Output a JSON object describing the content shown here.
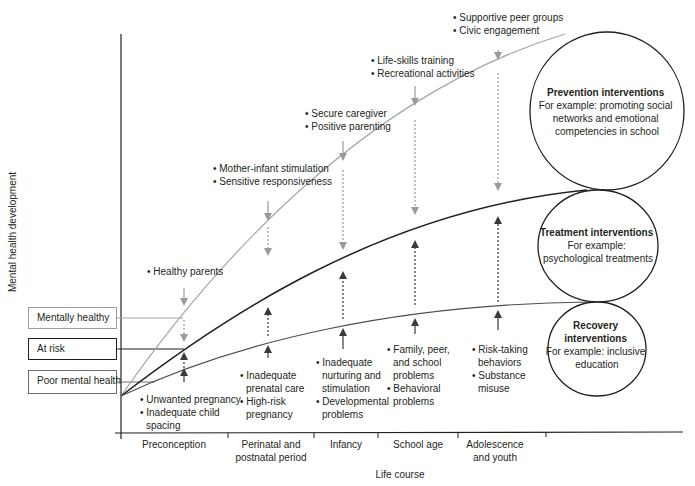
{
  "axes": {
    "y_label": "Mental health development",
    "x_label": "Life course",
    "stages": [
      {
        "lines": [
          "Preconception"
        ],
        "cx": 174
      },
      {
        "lines": [
          "Perinatal and",
          "postnatal period"
        ],
        "cx": 271
      },
      {
        "lines": [
          "Infancy"
        ],
        "cx": 346
      },
      {
        "lines": [
          "School age"
        ],
        "cx": 418
      },
      {
        "lines": [
          "Adolescence",
          "and youth"
        ],
        "cx": 495
      }
    ]
  },
  "levels": [
    {
      "label": "Mentally healthy",
      "border": "#9a9a9a"
    },
    {
      "label": "At risk",
      "border": "#231f20"
    },
    {
      "label": "Poor mental health",
      "border": "#6d6d6d"
    }
  ],
  "protective_factors": [
    {
      "stage": "Preconception",
      "items": [
        "Healthy parents"
      ]
    },
    {
      "stage": "Perinatal and postnatal period",
      "items": [
        "Mother-infant stimulation",
        "Sensitive responsiveness"
      ]
    },
    {
      "stage": "Infancy",
      "items": [
        "Secure caregiver",
        "Positive parenting"
      ]
    },
    {
      "stage": "School age",
      "items": [
        "Life-skills training",
        "Recreational activities"
      ]
    },
    {
      "stage": "Adolescence and youth",
      "items": [
        "Supportive peer groups",
        "Civic engagement"
      ]
    }
  ],
  "risk_factors": [
    {
      "stage": "Preconception",
      "items": [
        [
          "Unwanted pregnancy"
        ],
        [
          "Inadequate child",
          "spacing"
        ]
      ]
    },
    {
      "stage": "Perinatal and postnatal period",
      "items": [
        [
          "Inadequate",
          "prenatal care"
        ],
        [
          "High-risk",
          "pregnancy"
        ]
      ]
    },
    {
      "stage": "Infancy",
      "items": [
        [
          "Inadequate",
          "nurturing and",
          "stimulation"
        ],
        [
          "Developmental",
          "problems"
        ]
      ]
    },
    {
      "stage": "School age",
      "items": [
        [
          "Family, peer,",
          "and school",
          "problems"
        ],
        [
          "Behavioral",
          "problems"
        ]
      ]
    },
    {
      "stage": "Adolescence and youth",
      "items": [
        [
          "Risk-taking",
          "behaviors"
        ],
        [
          "Substance",
          "misuse"
        ]
      ]
    }
  ],
  "interventions": [
    {
      "title": "Prevention interventions",
      "body": [
        "For example: promoting social",
        "networks and emotional",
        "competencies in school"
      ]
    },
    {
      "title": "Treatment interventions",
      "body": [
        "For example:",
        "psychological treatments"
      ]
    },
    {
      "title_lines": [
        "Recovery",
        "interventions"
      ],
      "body": [
        "For example: inclusive",
        "education"
      ]
    }
  ],
  "colors": {
    "healthy_curve": "#a6a6a6",
    "risk_curve": "#231f20",
    "poor_curve": "#4d4d4d",
    "protective_arrow": "#9a9a9a",
    "risk_arrow": "#3a3a3a",
    "axis": "#231f20"
  }
}
